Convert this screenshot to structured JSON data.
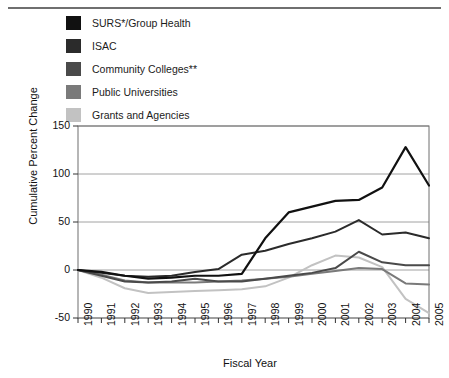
{
  "legend": {
    "items": [
      {
        "label": "SURS*/Group Health",
        "color": "#111111",
        "key": "surs"
      },
      {
        "label": "ISAC",
        "color": "#2b2b2b",
        "key": "isac"
      },
      {
        "label": "Community Colleges**",
        "color": "#4a4a4a",
        "key": "cc"
      },
      {
        "label": "Public Universities",
        "color": "#7a7a7a",
        "key": "pu"
      },
      {
        "label": "Grants and Agencies",
        "color": "#c2c2c2",
        "key": "grants"
      }
    ]
  },
  "axis": {
    "y_label": "Cumulative Percent Change",
    "x_label": "Fiscal Year",
    "y_ticks": [
      150,
      100,
      50,
      0,
      -50
    ],
    "x_ticks": [
      "1990",
      "1991",
      "1992",
      "1993",
      "1994",
      "1995",
      "1996",
      "1997",
      "1998",
      "1999",
      "2000",
      "2001",
      "2002",
      "2003",
      "2004",
      "2005"
    ]
  },
  "chart_data": {
    "type": "line",
    "title": "",
    "xlabel": "Fiscal Year",
    "ylabel": "Cumulative Percent Change",
    "x": [
      1990,
      1991,
      1992,
      1993,
      1994,
      1995,
      1996,
      1997,
      1998,
      1999,
      2000,
      2001,
      2002,
      2003,
      2004,
      2005
    ],
    "xlim": [
      1990,
      2005
    ],
    "ylim": [
      -50,
      150
    ],
    "grid": true,
    "legend_position": "top-left-outside",
    "series": [
      {
        "name": "SURS*/Group Health",
        "color": "#111111",
        "values": [
          0,
          -2,
          -6,
          -9,
          -8,
          -6,
          -6,
          -4,
          33,
          60,
          66,
          72,
          73,
          86,
          128,
          88
        ]
      },
      {
        "name": "ISAC",
        "color": "#2b2b2b",
        "values": [
          0,
          -3,
          -6,
          -7,
          -6,
          -2,
          1,
          16,
          20,
          27,
          33,
          40,
          52,
          37,
          39,
          33
        ]
      },
      {
        "name": "Community Colleges**",
        "color": "#4a4a4a",
        "values": [
          0,
          -6,
          -12,
          -13,
          -12,
          -9,
          -12,
          -12,
          -9,
          -6,
          -3,
          2,
          19,
          8,
          5,
          5
        ]
      },
      {
        "name": "Public Universities",
        "color": "#7a7a7a",
        "values": [
          0,
          -5,
          -11,
          -13,
          -13,
          -13,
          -12,
          -11,
          -9,
          -7,
          -4,
          -1,
          2,
          1,
          -14,
          -15
        ]
      },
      {
        "name": "Grants and Agencies",
        "color": "#c2c2c2",
        "values": [
          0,
          -8,
          -19,
          -24,
          -23,
          -22,
          -21,
          -20,
          -17,
          -8,
          5,
          15,
          13,
          3,
          -30,
          -45
        ]
      }
    ]
  }
}
